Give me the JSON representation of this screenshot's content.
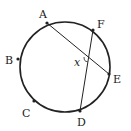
{
  "diagram": {
    "type": "circle-chords",
    "circle": {
      "cx": 65,
      "cy": 67,
      "r": 45
    },
    "points": [
      {
        "id": "A",
        "label": "A",
        "x": 47,
        "y": 23,
        "lx": 39,
        "ly": 18
      },
      {
        "id": "F",
        "label": "F",
        "x": 93,
        "y": 30,
        "lx": 97,
        "ly": 28
      },
      {
        "id": "B",
        "label": "B",
        "x": 18,
        "y": 59,
        "lx": 5,
        "ly": 64
      },
      {
        "id": "E",
        "label": "E",
        "x": 109,
        "y": 74,
        "lx": 113,
        "ly": 83
      },
      {
        "id": "C",
        "label": "C",
        "x": 34,
        "y": 101,
        "lx": 22,
        "ly": 117
      },
      {
        "id": "D",
        "label": "D",
        "x": 80,
        "y": 111,
        "lx": 77,
        "ly": 126
      }
    ],
    "chords": [
      {
        "from": "A",
        "to": "E"
      },
      {
        "from": "F",
        "to": "D"
      }
    ],
    "angle": {
      "label": "x",
      "at": {
        "x": 88,
        "y": 58
      },
      "lx": 74,
      "ly": 66
    }
  }
}
